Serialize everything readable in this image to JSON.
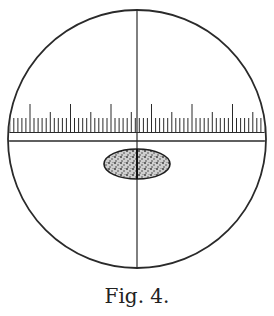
{
  "figure": {
    "caption": "Fig. 4.",
    "field_circle": {
      "cx": 137,
      "cy": 139,
      "r": 129
    },
    "crosshair": {
      "horizontal_y": 141,
      "vertical_x": 137
    },
    "scale": {
      "baseline_y": 132,
      "x_start": 10,
      "x_end": 264,
      "minor_spacing": 4.05,
      "major_every": 10,
      "medium_every": 5,
      "major_positions": [
        30,
        70,
        111,
        150,
        191,
        232
      ]
    },
    "object": {
      "type": "ellipse",
      "cx": 137,
      "cy": 164,
      "rx": 33,
      "ry": 15,
      "fill": "stippled"
    },
    "colors": {
      "ink": "#2a2a2a",
      "paper": "#ffffff"
    }
  }
}
